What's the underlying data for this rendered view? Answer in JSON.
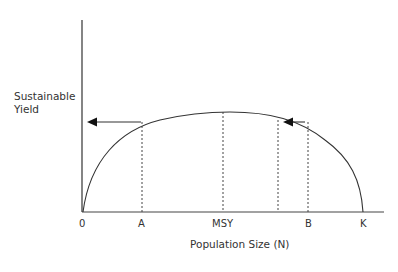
{
  "diagram": {
    "y_axis_label_line1": "Sustainable",
    "y_axis_label_line2": "Yield",
    "x_axis_label": "Population Size (N)",
    "ticks": {
      "origin": "0",
      "a": "A",
      "msy": "MSY",
      "b": "B",
      "k": "K"
    },
    "colors": {
      "line": "#333333",
      "background": "#ffffff"
    }
  }
}
